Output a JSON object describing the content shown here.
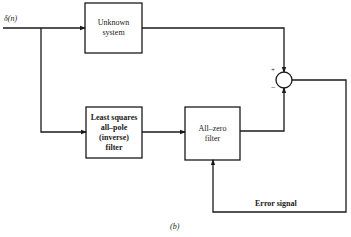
{
  "diagram": {
    "input_label": "δ(n)",
    "blocks": {
      "unknown_system": {
        "line1": "Unknown",
        "line2": "system"
      },
      "ls_filter": {
        "line1": "Least squares",
        "line2": "all–pole",
        "line3": "(inverse)",
        "line4": "filter"
      },
      "all_zero_filter": {
        "line1": "All–zero",
        "line2": "filter"
      }
    },
    "summer": {
      "plus": "+",
      "minus": "−"
    },
    "feedback_label": "Error signal",
    "caption": "(b)",
    "colors": {
      "line": "#1a1a1a",
      "background": "#ffffff"
    }
  }
}
